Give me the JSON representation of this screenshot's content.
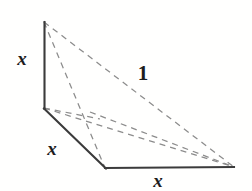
{
  "figure": {
    "background_color": "#fffffe",
    "solid_edge_color": "#3b3b3b",
    "hidden_edge_color": "#8c8c8c",
    "label_color": "#1d1d1d",
    "labels": [
      {
        "name": "height-label",
        "text": "x",
        "x": 22,
        "y": 58,
        "kind": "var"
      },
      {
        "name": "base-left-label",
        "text": "x",
        "x": 52,
        "y": 148,
        "kind": "var"
      },
      {
        "name": "base-front-label",
        "text": "x",
        "x": 158,
        "y": 180,
        "kind": "var"
      },
      {
        "name": "slant-label",
        "text": "1",
        "x": 143,
        "y": 73,
        "kind": "num"
      }
    ],
    "vertices": {
      "apex_top": [
        44,
        22
      ],
      "origin_corner": [
        44,
        108
      ],
      "base_front_left": [
        105,
        168
      ],
      "base_right": [
        234,
        167
      ],
      "hidden_back": [
        97,
        116
      ]
    },
    "solid_edges": [
      {
        "name": "vertical-edge",
        "from": [
          44,
          22
        ],
        "to": [
          44,
          108
        ]
      },
      {
        "name": "base-left-edge",
        "from": [
          44,
          108
        ],
        "to": [
          105,
          168
        ]
      },
      {
        "name": "base-front-edge",
        "from": [
          105,
          168
        ],
        "to": [
          234,
          167
        ]
      }
    ],
    "hidden_edges": [
      {
        "name": "slant-edge-top-to-right",
        "from": [
          44,
          22
        ],
        "to": [
          234,
          167
        ]
      },
      {
        "name": "hidden-edge-top-to-front",
        "from": [
          44,
          22
        ],
        "to": [
          105,
          168
        ]
      },
      {
        "name": "hidden-edge-origin-to-right",
        "from": [
          44,
          108
        ],
        "to": [
          234,
          167
        ]
      },
      {
        "name": "hidden-edge-back-to-right",
        "from": [
          97,
          116
        ],
        "to": [
          234,
          167
        ]
      },
      {
        "name": "hidden-edge-origin-to-back",
        "from": [
          44,
          108
        ],
        "to": [
          97,
          116
        ]
      }
    ],
    "dash_pattern": "6 5",
    "solid_stroke_width": 2.1,
    "hidden_stroke_width": 1.25
  }
}
